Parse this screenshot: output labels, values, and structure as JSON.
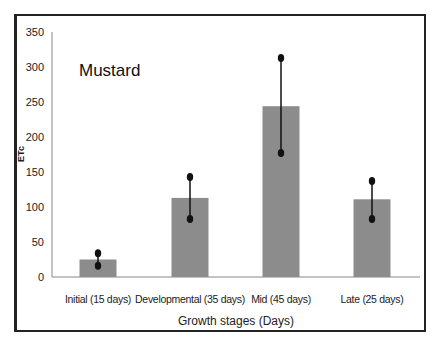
{
  "chart_data": {
    "type": "bar",
    "title": "Mustard",
    "xlabel": "Growth stages (Days)",
    "ylabel": "ETc",
    "categories": [
      "Initial (15 days)",
      "Developmental (35 days)",
      "Mid (45 days)",
      "Late (25 days)"
    ],
    "values": [
      25,
      113,
      244,
      111
    ],
    "error_bars": {
      "upper": [
        34,
        143,
        313,
        137
      ],
      "lower": [
        16,
        83,
        177,
        83
      ]
    },
    "ylim": [
      0,
      350
    ],
    "yticks": [
      0,
      50,
      100,
      150,
      200,
      250,
      300,
      350
    ],
    "grid": false,
    "legend": null,
    "colors": {
      "bar": "#8c8c8c",
      "error_bar": "#111111",
      "axis": "#888888",
      "frame": "#222222"
    }
  }
}
